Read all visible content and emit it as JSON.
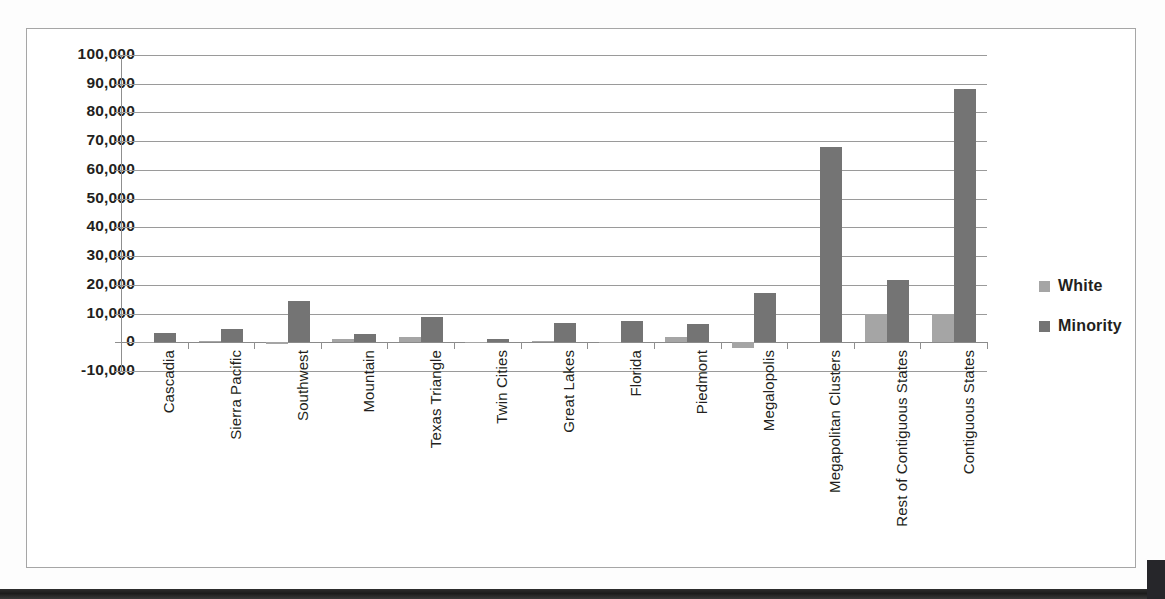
{
  "chart_data": {
    "type": "bar",
    "title": "",
    "subtitle": "",
    "xlabel": "",
    "ylabel": "",
    "grid": true,
    "legend_position": "right",
    "ylim": [
      -10000,
      100000
    ],
    "ytick_step": 10000,
    "ytick_labels": [
      "100,000",
      "90,000",
      "80,000",
      "70,000",
      "60,000",
      "50,000",
      "40,000",
      "30,000",
      "20,000",
      "10,000",
      "0",
      "-10,000"
    ],
    "ytick_values": [
      100000,
      90000,
      80000,
      70000,
      60000,
      50000,
      40000,
      30000,
      20000,
      10000,
      0,
      -10000
    ],
    "categories": [
      "Cascadia",
      "Sierra Pacific",
      "Southwest",
      "Mountain",
      "Texas Triangle",
      "Twin Cities",
      "Great Lakes",
      "Florida",
      "Piedmont",
      "Megalopolis",
      "Megapolitan Clusters",
      "Rest of Contiguous States",
      "Contiguous States"
    ],
    "series": [
      {
        "name": "White",
        "color": "#a5a5a5",
        "values": [
          200,
          600,
          -700,
          1000,
          1700,
          200,
          400,
          100,
          1900,
          -2000,
          0,
          9700,
          9800
        ]
      },
      {
        "name": "Minority",
        "color": "#747474",
        "values": [
          3300,
          4700,
          14300,
          3000,
          8800,
          1200,
          6700,
          7400,
          6300,
          17200,
          68000,
          21700,
          88300
        ]
      }
    ]
  },
  "legend": {
    "items": [
      {
        "label": "White",
        "color": "#a5a5a5"
      },
      {
        "label": "Minority",
        "color": "#747474"
      }
    ]
  },
  "colors": {
    "white_series": "#a5a5a5",
    "minority_series": "#747474",
    "gridline": "#9a9a9a",
    "axis": "#8f8f8f",
    "frame_border": "#a6a6a6",
    "text": "#231f20",
    "background": "#ffffff"
  }
}
